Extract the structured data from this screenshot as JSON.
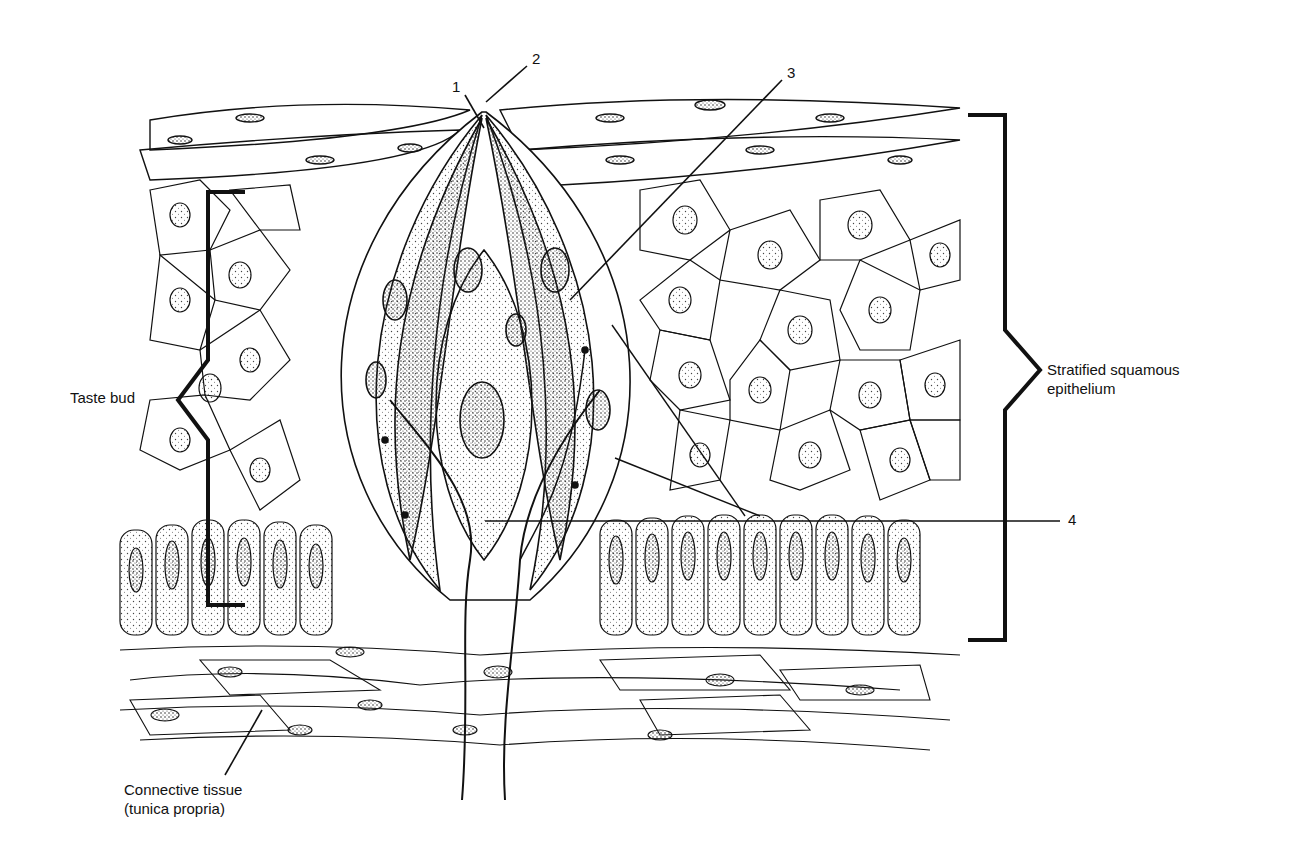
{
  "figure": {
    "labels": {
      "n1": "1",
      "n2": "2",
      "n3": "3",
      "n4": "4",
      "taste_bud": "Taste bud",
      "epithelium_line1": "Stratified squamous",
      "epithelium_line2": "epithelium",
      "connective_line1": "Connective tissue",
      "connective_line2": "(tunica propria)"
    },
    "colors": {
      "ink": "#111111",
      "background": "#ffffff",
      "stipple": "#555555"
    }
  }
}
